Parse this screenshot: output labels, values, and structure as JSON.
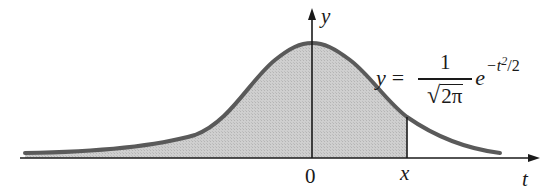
{
  "figure": {
    "curve_color": "#555555",
    "fill_color": "#c8c8c8",
    "axis_color": "#1a1a1a"
  },
  "axes": {
    "horizontal_label": "t",
    "vertical_label": "y"
  },
  "ticks": {
    "origin_label": "0",
    "marker_label": "x"
  },
  "formula": {
    "lhs": "y",
    "equals": "=",
    "numerator": "1",
    "sqrt_symbol": "√",
    "radicand": "2π",
    "base": "e",
    "exponent": "−t",
    "exponent_power": "2",
    "exponent_tail": "/2"
  }
}
